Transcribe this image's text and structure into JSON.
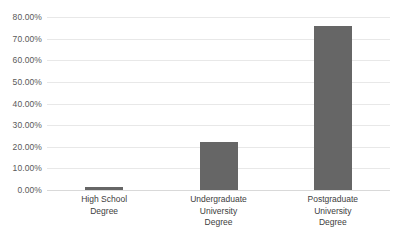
{
  "chart_data": {
    "type": "bar",
    "title": "",
    "subtitle": "",
    "xlabel": "",
    "ylabel": "",
    "categories": [
      "High School\nDegree",
      "Undergraduate\nUniversity\nDegree",
      "Postgraduate\nUniversity\nDegree"
    ],
    "values": [
      1.4,
      22.2,
      76.0
    ],
    "value_labels": [
      "1.40%",
      "22.20%",
      "76.00%"
    ],
    "series": [
      {
        "name": "Series 1",
        "values": [
          1.4,
          22.2,
          76.0
        ]
      }
    ],
    "ylim": [
      0,
      80
    ],
    "ytick_values": [
      0,
      10,
      20,
      30,
      40,
      50,
      60,
      70,
      80
    ],
    "ytick_labels": [
      "0.00%",
      "10.00%",
      "20.00%",
      "30.00%",
      "40.00%",
      "50.00%",
      "60.00%",
      "70.00%",
      "80.00%"
    ],
    "grid": true,
    "grid_axis": "y",
    "legend": false,
    "legend_position": "none",
    "bar_color": "#666666",
    "gridline_color": "#e8e8e8",
    "baseline_color": "#d9d9d9",
    "tick_label_color": "#595959",
    "category_label_color": "#404040",
    "background_color": "#ffffff"
  }
}
